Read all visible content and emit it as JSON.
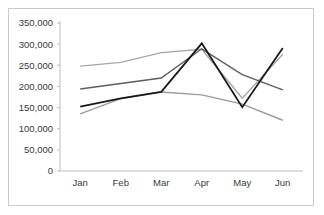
{
  "chart_data": {
    "type": "line",
    "title": "",
    "subtitle": "",
    "xlabel": "",
    "ylabel": "",
    "categories": [
      "Jan",
      "Feb",
      "Mar",
      "Apr",
      "May",
      "Jun"
    ],
    "ylim": [
      0,
      350000
    ],
    "yticks": [
      0,
      50000,
      100000,
      150000,
      200000,
      250000,
      300000,
      350000
    ],
    "ytick_labels": [
      "0",
      "50,000",
      "100,000",
      "150,000",
      "200,000",
      "250,000",
      "300,000",
      "350,000"
    ],
    "grid": false,
    "legend": "none",
    "series": [
      {
        "name": "series-1-light-gray",
        "color": "#a6a6a6",
        "width": 1.4,
        "values": [
          248000,
          257000,
          280000,
          288000,
          172000,
          276000
        ]
      },
      {
        "name": "series-2-mid-gray",
        "color": "#5e5e5e",
        "width": 1.4,
        "values": [
          194000,
          207000,
          220000,
          289000,
          228000,
          192000
        ]
      },
      {
        "name": "series-3-low-gray",
        "color": "#9a9a9a",
        "width": 1.4,
        "values": [
          135000,
          171000,
          187000,
          180000,
          158000,
          120000
        ]
      },
      {
        "name": "series-4-black",
        "color": "#1a1a1a",
        "width": 1.8,
        "values": [
          152000,
          172000,
          187000,
          302000,
          151000,
          291000
        ]
      }
    ]
  },
  "frame": {
    "border_color": "#c9c9c9",
    "background": "#ffffff"
  }
}
